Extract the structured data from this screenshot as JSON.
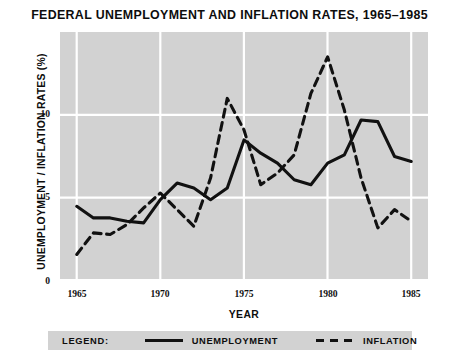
{
  "chart_data": {
    "type": "line",
    "title": "FEDERAL UNEMPLOYMENT AND INFLATION RATES, 1965–1985",
    "xlabel": "YEAR",
    "ylabel": "UNEMPLOYMENT / INFLATION RATES (%)",
    "x": [
      1965,
      1966,
      1967,
      1968,
      1969,
      1970,
      1971,
      1972,
      1973,
      1974,
      1975,
      1976,
      1977,
      1978,
      1979,
      1980,
      1981,
      1982,
      1983,
      1984,
      1985
    ],
    "xlim": [
      1964,
      1986
    ],
    "ylim": [
      0,
      15
    ],
    "xticks": [
      1965,
      1970,
      1975,
      1980,
      1985
    ],
    "yticks": [
      0,
      5,
      10
    ],
    "xtick_labels": [
      "1965",
      "1970",
      "1975",
      "1980",
      "1985"
    ],
    "ytick_labels": [
      "0",
      "5",
      "10"
    ],
    "grid": true,
    "legend_position": "below-plot",
    "series": [
      {
        "name": "UNEMPLOYMENT",
        "style": "solid",
        "color": "#111111",
        "values": [
          4.5,
          3.8,
          3.8,
          3.6,
          3.5,
          4.9,
          5.9,
          5.6,
          4.9,
          5.6,
          8.5,
          7.7,
          7.1,
          6.1,
          5.8,
          7.1,
          7.6,
          9.7,
          9.6,
          7.5,
          7.2
        ]
      },
      {
        "name": "INFLATION",
        "style": "dashed",
        "color": "#111111",
        "values": [
          1.6,
          2.9,
          2.8,
          3.4,
          4.4,
          5.3,
          4.3,
          3.3,
          6.2,
          11.0,
          9.1,
          5.8,
          6.5,
          7.6,
          11.3,
          13.5,
          10.3,
          6.2,
          3.2,
          4.3,
          3.6
        ]
      }
    ]
  },
  "legend": {
    "title": "LEGEND:",
    "entries": [
      {
        "label": "UNEMPLOYMENT",
        "style": "solid"
      },
      {
        "label": "INFLATION",
        "style": "dashed"
      }
    ]
  }
}
